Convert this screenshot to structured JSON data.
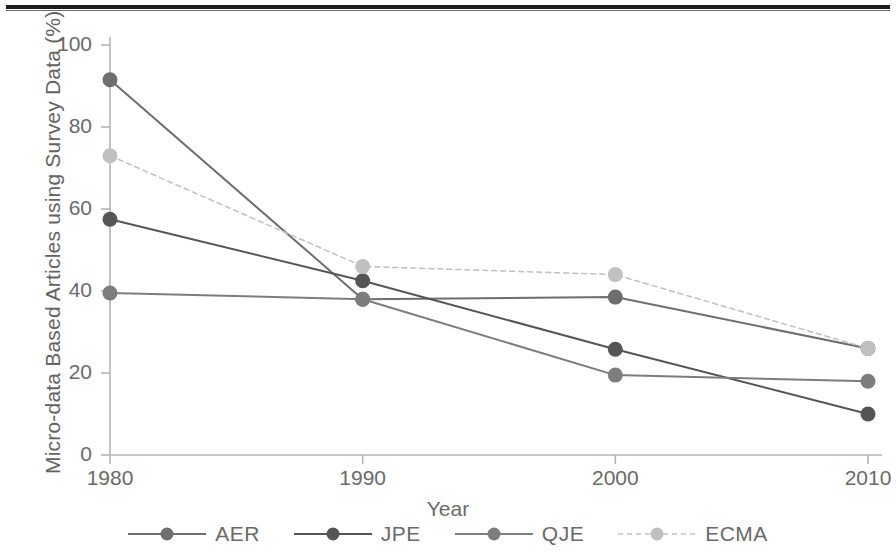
{
  "figure": {
    "has_top_rule": true,
    "background": "#ffffff"
  },
  "chart_data": {
    "type": "line",
    "title": "",
    "subtitle": "",
    "xlabel": "Year",
    "ylabel": "Micro-data Based Articles using Survey Data (%)",
    "x": [
      1980,
      1990,
      2000,
      2010
    ],
    "xticks": [
      "1980",
      "1990",
      "2000",
      "2010"
    ],
    "yticks": [
      "0",
      "20",
      "40",
      "60",
      "80",
      "100"
    ],
    "ytick_values": [
      0,
      20,
      40,
      60,
      80,
      100
    ],
    "xlim": [
      1976,
      2014
    ],
    "ylim": [
      0,
      104
    ],
    "grid": false,
    "legend_position": "bottom",
    "series": [
      {
        "name": "AER",
        "values": [
          91.5,
          38.0,
          38.5,
          26.0
        ],
        "color": "#6e6e6e",
        "line_style": "solid",
        "marker": "circle"
      },
      {
        "name": "JPE",
        "values": [
          57.5,
          42.5,
          25.8,
          10.0
        ],
        "color": "#555555",
        "line_style": "solid",
        "marker": "circle"
      },
      {
        "name": "QJE",
        "values": [
          39.5,
          38.0,
          19.5,
          18.0
        ],
        "color": "#7d7d7d",
        "line_style": "solid",
        "marker": "circle"
      },
      {
        "name": "ECMA",
        "values": [
          73.0,
          46.0,
          44.0,
          26.0
        ],
        "color": "#c0c0c0",
        "line_style": "dotted",
        "marker": "circle"
      }
    ]
  },
  "legend": {
    "items": [
      {
        "label": "AER",
        "color": "#6e6e6e",
        "style": "solid"
      },
      {
        "label": "JPE",
        "color": "#555555",
        "style": "solid"
      },
      {
        "label": "QJE",
        "color": "#7d7d7d",
        "style": "solid"
      },
      {
        "label": "ECMA",
        "color": "#c0c0c0",
        "style": "dotted"
      }
    ]
  },
  "axis_colors": {
    "axis_line": "#b4b4b4",
    "tick_text": "#6a6a6a",
    "label_text": "#636363"
  }
}
